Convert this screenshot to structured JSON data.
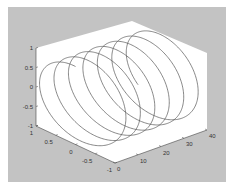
{
  "figure": {
    "background": "#c3c3c3",
    "axes_face": "#ffffff",
    "line_color": "#555555"
  },
  "chart_data": {
    "type": "line",
    "subtype": "3d-helix",
    "title": "",
    "xlabel": "",
    "ylabel": "",
    "zlabel": "",
    "axes": {
      "x": {
        "ticks": [
          "1",
          "0.5",
          "0",
          "-0.5",
          "-1"
        ],
        "range": [
          -1,
          1
        ]
      },
      "y": {
        "ticks": [
          "0",
          "10",
          "20",
          "30",
          "40"
        ],
        "range": [
          0,
          40
        ]
      },
      "z": {
        "ticks": [
          "1",
          "0.5",
          "0",
          "-0.5",
          "-1"
        ],
        "range": [
          -1,
          1
        ]
      }
    },
    "series": [
      {
        "name": "helix",
        "param": "t",
        "t_range": [
          0,
          40
        ],
        "x": "sin(t)",
        "z": "cos(t)",
        "y": "t",
        "turns": 6.4
      }
    ],
    "grid": false,
    "legend": null
  },
  "ticks": {
    "z": [
      "1",
      "0.5",
      "0",
      "-0.5",
      "-1"
    ],
    "x": [
      "1",
      "0.5",
      "0",
      "-0.5",
      "-1"
    ],
    "y": [
      "0",
      "10",
      "20",
      "30",
      "40"
    ]
  }
}
